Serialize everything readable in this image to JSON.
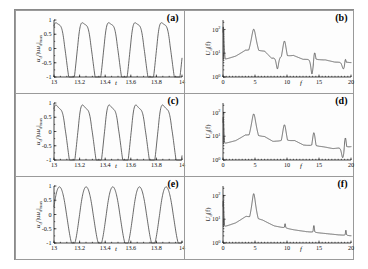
{
  "figure": {
    "rows": 3,
    "cols": 2,
    "background": "#ffffff",
    "curve_color": "#444444",
    "axis_color": "#1a1a1a"
  },
  "panels": [
    {
      "label": "(a)",
      "kind": "time"
    },
    {
      "label": "(b)",
      "kind": "spectrum"
    },
    {
      "label": "(c)",
      "kind": "time"
    },
    {
      "label": "(d)",
      "kind": "spectrum"
    },
    {
      "label": "(e)",
      "kind": "time"
    },
    {
      "label": "(f)",
      "kind": "spectrum"
    }
  ],
  "time_axes": {
    "xlabel": "t",
    "ylabel_main": "u",
    "ylabel_sub": "d",
    "ylabel_rest": "/|u",
    "ylabel_sub2": "d",
    "ylabel_tail": "|",
    "ylabel_max": "max",
    "xticks": [
      "13",
      "13.2",
      "13.4",
      "13.6",
      "13.8",
      "14"
    ],
    "xtickvals": [
      13,
      13.2,
      13.4,
      13.6,
      13.8,
      14
    ],
    "yticks": [
      "1",
      "0.5",
      "0",
      "-0.5",
      "-1"
    ],
    "ytickvals": [
      1,
      0.5,
      0,
      -0.5,
      -1
    ],
    "xlim": [
      13,
      14
    ],
    "ylim": [
      -1,
      1
    ]
  },
  "spec_axes": {
    "xlabel": "f",
    "ylabel_main": "U",
    "ylabel_sub": "d",
    "ylabel_tail": "(f)",
    "xticks": [
      "0",
      "5",
      "10",
      "15",
      "20"
    ],
    "xtickvals": [
      0,
      5,
      10,
      15,
      20
    ],
    "yticks": [
      "10",
      "10",
      "10"
    ],
    "yexps": [
      "2",
      "1",
      "0"
    ],
    "ytickvals": [
      100,
      10,
      1
    ],
    "xlim": [
      0,
      20
    ],
    "ylim": [
      1,
      250
    ]
  },
  "chart_data": [
    {
      "type": "line",
      "panel": "(a)",
      "title": "",
      "xlabel": "t",
      "ylabel": "u_d/|u_d|_max",
      "xlim": [
        13,
        14
      ],
      "ylim": [
        -1,
        1
      ],
      "grid": false,
      "description": "Periodic oscillation, ~5 cycles per unit time, rounded flat-topped crests and narrow V-shaped troughs",
      "waveform": {
        "base_freq": 4.85,
        "phase": 0.62,
        "crest_flatten": 0.3,
        "trough_sharpen": 0.55,
        "harmonic2": 0.12,
        "harmonic3": 0.05
      },
      "points_note": "curve sampled from waveform model over xlim"
    },
    {
      "type": "line",
      "panel": "(b)",
      "title": "",
      "xlabel": "f",
      "ylabel": "U_d(f)",
      "xlim": [
        0,
        20
      ],
      "ylim": [
        1,
        250
      ],
      "yscale": "log",
      "grid": false,
      "description": "Fourier spectrum with dominant peak near f=4.8 and decaying harmonics at 9.6, 14.3 and 19.1, each preceded by a sharp antiresonance dip",
      "peaks": [
        {
          "f": 0.05,
          "amplitude": 120,
          "width": 0.06,
          "type": "dc-spike"
        },
        {
          "f": 4.8,
          "amplitude": 95,
          "width": 0.3
        },
        {
          "f": 9.6,
          "amplitude": 30,
          "width": 0.26
        },
        {
          "f": 14.3,
          "amplitude": 11,
          "width": 0.22
        },
        {
          "f": 19.1,
          "amplitude": 6.5,
          "width": 0.2
        }
      ],
      "dips": [
        {
          "f": 8.5,
          "amplitude": 2.2
        },
        {
          "f": 13.9,
          "amplitude": 1.35
        },
        {
          "f": 18.8,
          "amplitude": 2.2
        }
      ],
      "baseline": [
        {
          "f": 0.4,
          "value": 5.5
        },
        {
          "f": 2.0,
          "value": 7.5
        },
        {
          "f": 3.5,
          "value": 13
        },
        {
          "f": 6.5,
          "value": 12
        },
        {
          "f": 7.6,
          "value": 6.0
        },
        {
          "f": 11.0,
          "value": 8.0
        },
        {
          "f": 12.5,
          "value": 5.5
        },
        {
          "f": 16.0,
          "value": 5.2
        },
        {
          "f": 17.5,
          "value": 4.2
        },
        {
          "f": 20.0,
          "value": 4.0
        }
      ]
    },
    {
      "type": "line",
      "panel": "(c)",
      "title": "",
      "xlabel": "t",
      "ylabel": "u_d/|u_d|_max",
      "xlim": [
        13,
        14
      ],
      "ylim": [
        -1,
        1
      ],
      "grid": false,
      "description": "Periodic oscillation, ~4.8 cycles per unit time, broad rounded crests with slightly asymmetric shoulders and narrow troughs",
      "waveform": {
        "base_freq": 4.8,
        "phase": 0.55,
        "crest_flatten": 0.42,
        "trough_sharpen": 0.45,
        "harmonic2": 0.16,
        "harmonic3": 0.03
      }
    },
    {
      "type": "line",
      "panel": "(d)",
      "title": "",
      "xlabel": "f",
      "ylabel": "U_d(f)",
      "xlim": [
        0,
        20
      ],
      "ylim": [
        1,
        250
      ],
      "yscale": "log",
      "grid": false,
      "description": "Spectrum with dominant peak near f=4.8, secondary peaks at 9.6 and 14.2 and a rising feature near 19",
      "peaks": [
        {
          "f": 0.05,
          "amplitude": 60,
          "width": 0.06,
          "type": "dc-spike"
        },
        {
          "f": 4.8,
          "amplitude": 80,
          "width": 0.28
        },
        {
          "f": 9.6,
          "amplitude": 28,
          "width": 0.26
        },
        {
          "f": 14.2,
          "amplitude": 13,
          "width": 0.22
        },
        {
          "f": 19.1,
          "amplitude": 9,
          "width": 0.18
        }
      ],
      "dips": [
        {
          "f": 18.7,
          "amplitude": 1.25
        }
      ],
      "baseline": [
        {
          "f": 0.4,
          "value": 5.0
        },
        {
          "f": 2.0,
          "value": 6.5
        },
        {
          "f": 3.5,
          "value": 11
        },
        {
          "f": 6.5,
          "value": 9.5
        },
        {
          "f": 7.8,
          "value": 6.0
        },
        {
          "f": 11.2,
          "value": 6.5
        },
        {
          "f": 12.6,
          "value": 4.2
        },
        {
          "f": 15.6,
          "value": 3.6
        },
        {
          "f": 17.2,
          "value": 3.0
        },
        {
          "f": 20.0,
          "value": 3.6
        }
      ]
    },
    {
      "type": "line",
      "panel": "(e)",
      "title": "",
      "xlabel": "t",
      "ylabel": "u_d/|u_d|_max",
      "xlim": [
        13,
        14
      ],
      "ylim": [
        -1,
        1
      ],
      "grid": false,
      "description": "Nearly pure sinusoidal oscillation, ~4.8 cycles per unit time, symmetric rounded crests and troughs",
      "waveform": {
        "base_freq": 4.8,
        "phase": 0.22,
        "crest_flatten": 0.1,
        "trough_sharpen": 0.12,
        "harmonic2": 0.04,
        "harmonic3": 0.0
      }
    },
    {
      "type": "line",
      "panel": "(f)",
      "title": "",
      "xlabel": "f",
      "ylabel": "U_d(f)",
      "xlim": [
        0,
        20
      ],
      "ylim": [
        1,
        250
      ],
      "yscale": "log",
      "grid": false,
      "description": "Spectrum dominated by a single sharp fundamental peak at f=4.8 with much weaker harmonics at 9.6, 14.2 and 19.1 on a smoothly decaying background",
      "peaks": [
        {
          "f": 0.05,
          "amplitude": 55,
          "width": 0.06,
          "type": "dc-spike"
        },
        {
          "f": 4.8,
          "amplitude": 110,
          "width": 0.22
        },
        {
          "f": 9.7,
          "amplitude": 6.0,
          "width": 0.16
        },
        {
          "f": 14.2,
          "amplitude": 5.0,
          "width": 0.15
        },
        {
          "f": 19.2,
          "amplitude": 3.2,
          "width": 0.14
        }
      ],
      "dips": [],
      "baseline": [
        {
          "f": 0.4,
          "value": 5.0
        },
        {
          "f": 2.0,
          "value": 7.0
        },
        {
          "f": 3.6,
          "value": 13
        },
        {
          "f": 6.2,
          "value": 9.0
        },
        {
          "f": 8.0,
          "value": 5.2
        },
        {
          "f": 11.0,
          "value": 3.6
        },
        {
          "f": 13.0,
          "value": 3.0
        },
        {
          "f": 16.0,
          "value": 2.5
        },
        {
          "f": 18.0,
          "value": 2.2
        },
        {
          "f": 20.0,
          "value": 2.0
        }
      ]
    }
  ]
}
